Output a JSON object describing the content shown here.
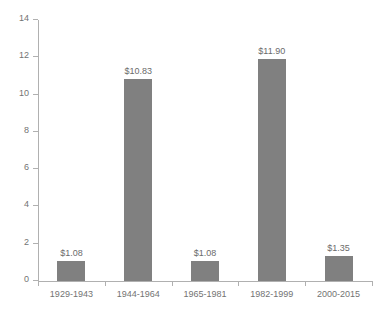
{
  "chart_data": {
    "type": "bar",
    "title": "",
    "title_clipped": true,
    "xlabel": "",
    "ylabel": "",
    "categories": [
      "1929-1943",
      "1944-1964",
      "1965-1981",
      "1982-1999",
      "2000-2015"
    ],
    "values": [
      1.08,
      10.83,
      1.08,
      11.9,
      1.35
    ],
    "data_labels": [
      "$1.08",
      "$10.83",
      "$1.08",
      "$11.90",
      "$1.35"
    ],
    "ylim": [
      0,
      14
    ],
    "ytick_values": [
      0,
      2,
      4,
      6,
      8,
      10,
      12,
      14
    ],
    "ytick_labels": [
      "0",
      "2",
      "4",
      "6",
      "8",
      "10",
      "12",
      "14"
    ],
    "grid": false,
    "legend": false,
    "series": [
      {
        "name": "",
        "values": [
          1.08,
          10.83,
          1.08,
          11.9,
          1.35
        ],
        "color": "#808080"
      }
    ]
  },
  "style": {
    "bar_color": "#808080",
    "axis_color": "#b0b0b0",
    "label_color": "#737373",
    "value_label_color": "#6b6b6b",
    "background": "#ffffff"
  }
}
